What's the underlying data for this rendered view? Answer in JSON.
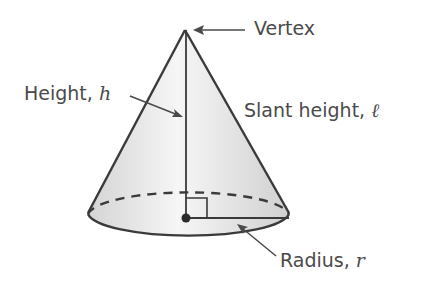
{
  "diagram": {
    "labels": {
      "vertex": {
        "text": "Vertex"
      },
      "height": {
        "text": "Height, ",
        "var": "h"
      },
      "slant_height": {
        "text": "Slant height, ",
        "var": "ℓ"
      },
      "radius": {
        "text": "Radius, ",
        "var": "r"
      }
    },
    "colors": {
      "stroke": "#3a3a3a",
      "fill_light": "#f4f4f4",
      "fill_dark": "#d6d6d6",
      "text": "#4a4a4a"
    }
  }
}
